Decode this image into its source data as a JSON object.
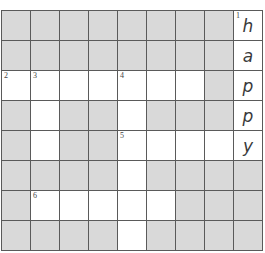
{
  "puzzle": {
    "rows": 8,
    "cols": 9,
    "colors": {
      "block": "#d9d9d9",
      "open": "#ffffff",
      "grid_line": "#5a5a5a",
      "text": "#3a3a3a"
    },
    "grid": [
      [
        {
          "b": 1
        },
        {
          "b": 1
        },
        {
          "b": 1
        },
        {
          "b": 1
        },
        {
          "b": 1
        },
        {
          "b": 1
        },
        {
          "b": 1
        },
        {
          "b": 1
        },
        {
          "b": 0,
          "n": "1",
          "l": "h"
        }
      ],
      [
        {
          "b": 1
        },
        {
          "b": 1
        },
        {
          "b": 1
        },
        {
          "b": 1
        },
        {
          "b": 1
        },
        {
          "b": 1
        },
        {
          "b": 1
        },
        {
          "b": 1
        },
        {
          "b": 0,
          "l": "a"
        }
      ],
      [
        {
          "b": 0,
          "n": "2"
        },
        {
          "b": 0,
          "n": "3"
        },
        {
          "b": 0
        },
        {
          "b": 0
        },
        {
          "b": 0,
          "n": "4"
        },
        {
          "b": 0
        },
        {
          "b": 0
        },
        {
          "b": 1
        },
        {
          "b": 0,
          "l": "p"
        }
      ],
      [
        {
          "b": 1
        },
        {
          "b": 0
        },
        {
          "b": 1
        },
        {
          "b": 1
        },
        {
          "b": 0
        },
        {
          "b": 1
        },
        {
          "b": 1
        },
        {
          "b": 1
        },
        {
          "b": 0,
          "l": "p"
        }
      ],
      [
        {
          "b": 1
        },
        {
          "b": 0
        },
        {
          "b": 1
        },
        {
          "b": 1
        },
        {
          "b": 0,
          "n": "5"
        },
        {
          "b": 0
        },
        {
          "b": 0
        },
        {
          "b": 0
        },
        {
          "b": 0,
          "l": "y"
        }
      ],
      [
        {
          "b": 1
        },
        {
          "b": 1
        },
        {
          "b": 1
        },
        {
          "b": 1
        },
        {
          "b": 0
        },
        {
          "b": 1
        },
        {
          "b": 1
        },
        {
          "b": 1
        },
        {
          "b": 1
        }
      ],
      [
        {
          "b": 1
        },
        {
          "b": 0,
          "n": "6"
        },
        {
          "b": 0
        },
        {
          "b": 0
        },
        {
          "b": 0
        },
        {
          "b": 0
        },
        {
          "b": 1
        },
        {
          "b": 1
        },
        {
          "b": 1
        }
      ],
      [
        {
          "b": 1
        },
        {
          "b": 1
        },
        {
          "b": 1
        },
        {
          "b": 1
        },
        {
          "b": 0
        },
        {
          "b": 1
        },
        {
          "b": 1
        },
        {
          "b": 1
        },
        {
          "b": 1
        }
      ]
    ]
  }
}
